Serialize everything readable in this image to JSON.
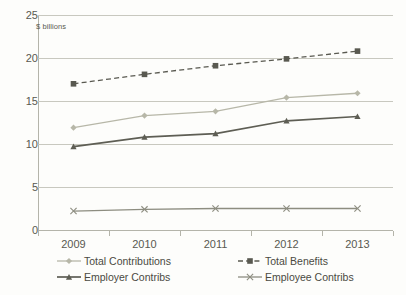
{
  "chart_data": {
    "type": "line",
    "title": "",
    "subtitle": "",
    "annotation": "$ billions",
    "xlabel": "",
    "ylabel": "",
    "categories": [
      "2009",
      "2010",
      "2011",
      "2012",
      "2013"
    ],
    "x": [
      2009,
      2010,
      2011,
      2012,
      2013
    ],
    "ylim": [
      0,
      25
    ],
    "yticks": [
      0,
      5,
      10,
      15,
      20,
      25
    ],
    "ytick_labels": [
      "0",
      "5",
      "10",
      "15",
      "20",
      "25"
    ],
    "grid": true,
    "legend_position": "bottom",
    "series": [
      {
        "name": "Total Contributions",
        "values": [
          11.9,
          13.3,
          13.8,
          15.4,
          15.9
        ],
        "color": "#b7b7a8",
        "marker": "diamond",
        "dash": "solid"
      },
      {
        "name": "Total Benefits",
        "values": [
          17.0,
          18.1,
          19.1,
          19.9,
          20.8
        ],
        "color": "#595950",
        "marker": "square",
        "dash": "dashed"
      },
      {
        "name": "Employer Contribs",
        "values": [
          9.7,
          10.8,
          11.2,
          12.7,
          13.2
        ],
        "color": "#5e5e54",
        "marker": "triangle",
        "dash": "solid"
      },
      {
        "name": "Employee Contribs",
        "values": [
          2.2,
          2.4,
          2.5,
          2.5,
          2.5
        ],
        "color": "#8d8d80",
        "marker": "cross",
        "dash": "solid"
      }
    ]
  },
  "axes": {
    "y_tick_labels": [
      "25",
      "20",
      "15",
      "10",
      "5",
      "0"
    ],
    "x_tick_labels": [
      "2009",
      "2010",
      "2011",
      "2012",
      "2013"
    ]
  },
  "legend": {
    "items": [
      {
        "label": "Total Contributions"
      },
      {
        "label": "Total Benefits"
      },
      {
        "label": "Employer Contribs"
      },
      {
        "label": "Employee Contribs"
      }
    ]
  },
  "colors": {
    "background": "#fdfdfb",
    "grid": "#c8c8bf",
    "axis": "#b4b4aa",
    "text": "#4a4a42"
  }
}
